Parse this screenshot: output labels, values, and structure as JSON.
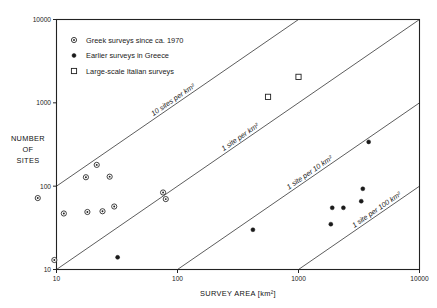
{
  "chart_data": {
    "type": "scatter",
    "title": "",
    "xlabel": "SURVEY AREA [km²]",
    "ylabel": "NUMBER OF SITES",
    "ylabel_lines": [
      "NUMBER",
      "OF",
      "SITES"
    ],
    "xscale": "log",
    "yscale": "log",
    "xlim": [
      10,
      10000
    ],
    "ylim": [
      10,
      10000
    ],
    "xticks": [
      10,
      100,
      1000,
      10000
    ],
    "xticklabels": [
      "10",
      "100",
      "1000",
      "10000"
    ],
    "yticks": [
      10,
      100,
      1000,
      10000
    ],
    "yticklabels": [
      "10",
      "100",
      "1000",
      "10000"
    ],
    "grid": false,
    "legend_position": "top-left",
    "series": [
      {
        "name": "Greek surveys since ca. 1970",
        "marker": "circle-with-dot",
        "points": [
          [
            2.6,
            24
          ],
          [
            2.6,
            20
          ],
          [
            7.0,
            72
          ],
          [
            9.6,
            13
          ],
          [
            11.5,
            47
          ],
          [
            17.5,
            128
          ],
          [
            18.0,
            49
          ],
          [
            21.5,
            180
          ],
          [
            24.0,
            50
          ],
          [
            27.5,
            130
          ],
          [
            30.0,
            57
          ],
          [
            76.0,
            84
          ],
          [
            80.0,
            70
          ]
        ]
      },
      {
        "name": "Earlier surveys in Greece",
        "marker": "filled-circle",
        "points": [
          [
            32.0,
            14
          ],
          [
            420.0,
            30
          ],
          [
            1850.0,
            35
          ],
          [
            1900.0,
            55
          ],
          [
            2350.0,
            55
          ],
          [
            3300.0,
            66
          ],
          [
            3400.0,
            93
          ],
          [
            3800.0,
            340
          ]
        ]
      },
      {
        "name": "Large-scale Italian surveys",
        "marker": "open-square",
        "points": [
          [
            560.0,
            1180
          ],
          [
            1000.0,
            2050
          ]
        ]
      }
    ],
    "reference_lines": [
      {
        "label": "10 sites per km²",
        "density": 10
      },
      {
        "label": "1 site per km²",
        "density": 1
      },
      {
        "label": "1 site per 10 km²",
        "density": 0.1
      },
      {
        "label": "1 site per 100 km²",
        "density": 0.01
      }
    ]
  },
  "legend": {
    "items": [
      {
        "label": "Greek surveys since ca. 1970"
      },
      {
        "label": "Earlier surveys in Greece"
      },
      {
        "label": "Large-scale Italian surveys"
      }
    ]
  },
  "colors": {
    "axis": "#222222",
    "marker": "#1a1a1a",
    "background": "#ffffff"
  }
}
